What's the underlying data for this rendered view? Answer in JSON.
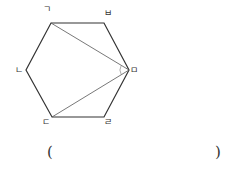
{
  "diagram": {
    "shape": "regular-hexagon",
    "stroke_color": "#333333",
    "diagonal_color": "#555555",
    "vertices": [
      {
        "name": "ㄱ",
        "x": 51,
        "y": 23,
        "label_x": 47,
        "label_y": 9
      },
      {
        "name": "ㅂ",
        "x": 104,
        "y": 23,
        "label_x": 108,
        "label_y": 13
      },
      {
        "name": "ㅁ",
        "x": 129,
        "y": 70,
        "label_x": 134,
        "label_y": 70
      },
      {
        "name": "ㄹ",
        "x": 104,
        "y": 117,
        "label_x": 108,
        "label_y": 122
      },
      {
        "name": "ㄷ",
        "x": 52,
        "y": 117,
        "label_x": 46,
        "label_y": 122
      },
      {
        "name": "ㄴ",
        "x": 26,
        "y": 70,
        "label_x": 19,
        "label_y": 70
      }
    ],
    "diagonals": [
      {
        "from": "ㅁ",
        "to": "ㄱ"
      },
      {
        "from": "ㅁ",
        "to": "ㄷ"
      }
    ],
    "angle_mark": {
      "at": "ㅁ",
      "between": [
        "ㄱ",
        "ㄷ"
      ],
      "radius": 9
    }
  },
  "answer_blank": {
    "open_paren": "(",
    "close_paren": ")",
    "value": ""
  }
}
